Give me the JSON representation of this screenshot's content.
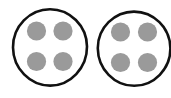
{
  "canvas": {
    "width": 171,
    "height": 98,
    "background_color": "#ffffff",
    "title": "Two circles each containing four dots"
  },
  "style": {
    "outline_color": "#111111",
    "outline_width": 2.6,
    "circle_fill": "#ffffff",
    "dot_color": "#9a9a9a",
    "dot_edge_color": "#8f8f8f"
  },
  "diagram": {
    "type": "sketch",
    "shape_count": 2,
    "dots_per_shape": 4,
    "dot_arrangement": "2x2-grid",
    "shapes": [
      {
        "name": "left-circle",
        "label": "",
        "cx": 50,
        "cy": 47.5,
        "rx": 37,
        "ry": 38,
        "clipped": false,
        "dots": [
          {
            "name": "dot-top-left",
            "cx": 36.5,
            "cy": 31.0,
            "r": 9.6
          },
          {
            "name": "dot-top-right",
            "cx": 63.0,
            "cy": 31.0,
            "r": 9.6
          },
          {
            "name": "dot-bottom-left",
            "cx": 36.5,
            "cy": 61.5,
            "r": 9.6
          },
          {
            "name": "dot-bottom-right",
            "cx": 63.0,
            "cy": 61.5,
            "r": 9.6
          }
        ]
      },
      {
        "name": "right-circle",
        "label": "",
        "cx": 134,
        "cy": 48.5,
        "rx": 36,
        "ry": 37,
        "clipped": true,
        "dots": [
          {
            "name": "dot-top-left",
            "cx": 120.5,
            "cy": 32.0,
            "r": 9.6
          },
          {
            "name": "dot-top-right",
            "cx": 147.5,
            "cy": 32.0,
            "r": 9.6
          },
          {
            "name": "dot-bottom-left",
            "cx": 120.5,
            "cy": 62.5,
            "r": 9.6
          },
          {
            "name": "dot-bottom-right",
            "cx": 147.5,
            "cy": 62.5,
            "r": 9.6
          }
        ]
      }
    ]
  }
}
